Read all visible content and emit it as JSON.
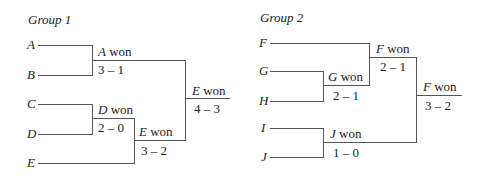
{
  "groups": [
    {
      "title": "Group 1",
      "teams": [
        "A",
        "B",
        "C",
        "D",
        "E"
      ],
      "matches": [
        {
          "winner": "A",
          "won_text": "won",
          "score": "3 – 1"
        },
        {
          "winner": "D",
          "won_text": "won",
          "score": "2 – 0"
        },
        {
          "winner": "E",
          "won_text": "won",
          "score": "3 – 2"
        },
        {
          "winner": "E",
          "won_text": "won",
          "score": "4 – 3"
        }
      ]
    },
    {
      "title": "Group 2",
      "teams": [
        "F",
        "G",
        "H",
        "I",
        "J"
      ],
      "matches": [
        {
          "winner": "G",
          "won_text": "won",
          "score": "2 – 1"
        },
        {
          "winner": "F",
          "won_text": "won",
          "score": "2 – 1"
        },
        {
          "winner": "J",
          "won_text": "won",
          "score": "1 – 0"
        },
        {
          "winner": "F",
          "won_text": "won",
          "score": "3 – 2"
        }
      ]
    }
  ]
}
